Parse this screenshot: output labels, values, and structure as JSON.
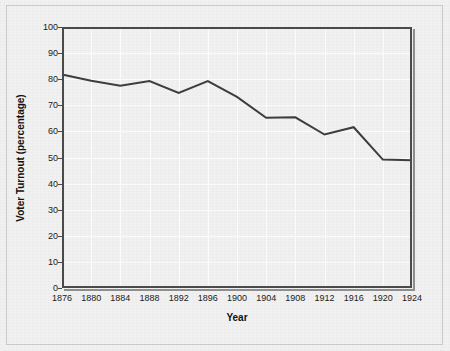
{
  "chart_data": {
    "type": "line",
    "title": "",
    "subtitle": "",
    "xlabel": "Year",
    "ylabel": "Voter Turnout (percentage)",
    "x": [
      1876,
      1880,
      1884,
      1888,
      1892,
      1896,
      1900,
      1904,
      1908,
      1912,
      1916,
      1920,
      1924
    ],
    "xtick_labels": [
      "1876",
      "1880",
      "1884",
      "1888",
      "1892",
      "1896",
      "1900",
      "1904",
      "1908",
      "1912",
      "1916",
      "1920",
      "1924"
    ],
    "ytick_labels": [
      "0",
      "10",
      "20",
      "30",
      "40",
      "50",
      "60",
      "70",
      "80",
      "90",
      "100"
    ],
    "ytick_values": [
      0,
      10,
      20,
      30,
      40,
      50,
      60,
      70,
      80,
      90,
      100
    ],
    "values": [
      81.8,
      79.4,
      77.5,
      79.3,
      74.7,
      79.3,
      73.2,
      65.2,
      65.4,
      58.8,
      61.6,
      49.2,
      48.9
    ],
    "series": [
      {
        "name": "Voter Turnout",
        "values": [
          81.8,
          79.4,
          77.5,
          79.3,
          74.7,
          79.3,
          73.2,
          65.2,
          65.4,
          58.8,
          61.6,
          49.2,
          48.9
        ]
      }
    ],
    "xlim": [
      1876,
      1924
    ],
    "ylim": [
      0,
      100
    ],
    "grid": true,
    "grid_color": "#fbfbfb",
    "legend": false,
    "legend_position": "none",
    "line_color": "#3d3d3d",
    "line_width": 2,
    "markers": false,
    "background_color": "#e9e9e9",
    "axis_color": "#4a4a4a",
    "annotations": []
  }
}
